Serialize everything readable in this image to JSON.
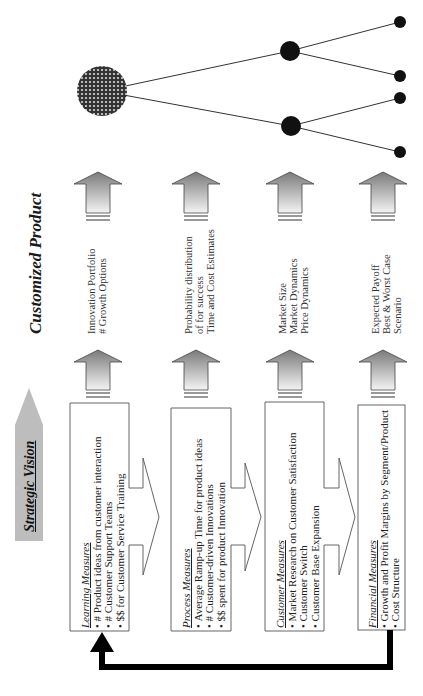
{
  "diagram": {
    "title": "Customized Product",
    "strategic_vision_label": "Strategic Vision",
    "colors": {
      "arrow_gradient_top": "#7a7a7a",
      "arrow_gradient_bottom": "#f2f2f2",
      "strategic_vision_fill": "#bdbdbd",
      "node_fill": "#111111",
      "root_node_fill": "#555555",
      "feedback_arrow": "#000000",
      "box_border": "#555555"
    },
    "measures": [
      {
        "header": "Learning Measures",
        "items": [
          "# Product ideas from customer interaction",
          "# Customer Support Teams",
          "$$ for Customer Service Training"
        ],
        "outputs": [
          "Innovation Portfolio",
          "# Growth Options"
        ]
      },
      {
        "header": "Process Measures",
        "items": [
          "Average Ramp-up Time for product ideas",
          "# Customer-driven Innovations",
          "$$ spent for product Innovation"
        ],
        "outputs": [
          "Probability distribution",
          "of for success",
          "Time and Cost Estimates"
        ]
      },
      {
        "header": "Customer Measures",
        "items": [
          "Market Research on Customer Satisfaction",
          "Customer Switch",
          "Customer Base Expansion"
        ],
        "outputs": [
          "Market Size",
          "Market Dynamics",
          "Price Dynamics"
        ]
      },
      {
        "header": "Financial Measures",
        "items": [
          "Growth and Profit Margins by Segment/Product",
          "Cost Structure"
        ],
        "outputs": [
          "Expected Payoff",
          "Best & Worst Case",
          "Scenario"
        ]
      }
    ],
    "tree": {
      "root": {
        "cx": 102,
        "cy": 91,
        "r": 25
      },
      "branches": [
        {
          "cx": 290,
          "cy": 51,
          "r": 10,
          "leaves": [
            {
              "cx": 400,
              "cy": 22,
              "r": 6
            },
            {
              "cx": 400,
              "cy": 76,
              "r": 6
            }
          ]
        },
        {
          "cx": 291,
          "cy": 126,
          "r": 10,
          "leaves": [
            {
              "cx": 400,
              "cy": 98,
              "r": 6
            },
            {
              "cx": 400,
              "cy": 152,
              "r": 6
            }
          ]
        }
      ]
    }
  }
}
